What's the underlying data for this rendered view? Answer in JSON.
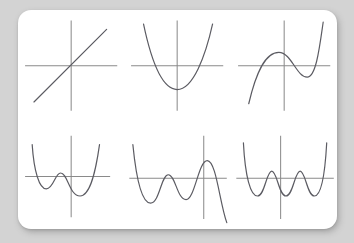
{
  "page": {
    "background_color": "#d3d3d3",
    "card_color": "#ffffff",
    "axis_color": "#8a8a8a",
    "curve_color": "#5c5c63"
  },
  "chart_data": [
    {
      "type": "line",
      "title": "Degree 1 linear function",
      "degree": 1,
      "leading_coefficient_sign": "positive",
      "turning_points": 0,
      "x_intercepts": 1,
      "shape": "straight line through origin with positive slope",
      "grid": false,
      "legend": "none",
      "xlabel": "",
      "ylabel": "",
      "xlim": [
        -5,
        5
      ],
      "ylim": [
        -5,
        5
      ],
      "x": [
        -4.2,
        -3,
        -2,
        -1,
        0,
        1,
        2,
        3,
        3.6
      ],
      "y": [
        -4.2,
        -3,
        -2,
        -1,
        0,
        1,
        2,
        3,
        3.6
      ],
      "axis": {
        "x_axis_y": 0,
        "y_axis_x": 0
      },
      "path": "M 18 102 L 100 20",
      "axis_h": "M 8 61 L 112 61",
      "axis_v": "M 60 10 L 60 112"
    },
    {
      "type": "line",
      "title": "Degree 2 quadratic function",
      "degree": 2,
      "leading_coefficient_sign": "positive",
      "turning_points": 1,
      "x_intercepts": 2,
      "shape": "upward parabola with vertex below the x-axis",
      "grid": false,
      "legend": "none",
      "xlabel": "",
      "ylabel": "",
      "xlim": [
        -5,
        5
      ],
      "ylim": [
        -5,
        5
      ],
      "x": [
        -2.6,
        -2,
        -1,
        0,
        0.4,
        1,
        2,
        2.6,
        3.2
      ],
      "y": [
        4.5,
        2.4,
        -0.2,
        -1.5,
        -1.7,
        -1.2,
        1.2,
        3.4,
        5.2
      ],
      "axis": {
        "x_axis_y": 0,
        "y_axis_x": 0
      },
      "path": "M 22 14 C 30 52, 42 88, 60 88 C 78 88, 92 50, 100 14",
      "axis_h": "M 8 61 L 112 61",
      "axis_v": "M 60 10 L 60 112"
    },
    {
      "type": "line",
      "title": "Degree 3 cubic function",
      "degree": 3,
      "leading_coefficient_sign": "positive",
      "turning_points": 2,
      "x_intercepts": 3,
      "shape": "cubic rising from lower-left with a local maximum then a local minimum",
      "grid": false,
      "legend": "none",
      "xlabel": "",
      "ylabel": "",
      "xlim": [
        -5,
        5
      ],
      "ylim": [
        -5,
        5
      ],
      "x": [
        -3.4,
        -2.6,
        -1.8,
        -1,
        -0.2,
        0.6,
        1.4,
        2.2,
        2.8
      ],
      "y": [
        -4.6,
        -1.4,
        0.7,
        1.3,
        0.9,
        -0.3,
        -0.9,
        1.6,
        5.0
      ],
      "axis": {
        "x_axis_y": 0,
        "y_axis_x": 0
      },
      "path": "M 20 104 C 28 70, 38 46, 54 46 C 68 46, 74 74, 86 74 C 96 74, 100 40, 104 12",
      "axis_h": "M 8 61 L 112 61",
      "axis_v": "M 60 10 L 60 112"
    },
    {
      "type": "line",
      "title": "Degree 4 quartic function",
      "degree": 4,
      "leading_coefficient_sign": "positive",
      "turning_points": 3,
      "x_intercepts": 3,
      "shape": "W-shaped quartic with two local minima and one local maximum",
      "grid": false,
      "legend": "none",
      "xlabel": "",
      "ylabel": "",
      "xlim": [
        -5,
        5
      ],
      "ylim": [
        -5,
        5
      ],
      "x": [
        -3.2,
        -2.6,
        -2,
        -1.4,
        -0.6,
        0.2,
        1,
        1.8,
        2.6
      ],
      "y": [
        4.6,
        1.4,
        -0.5,
        0.3,
        -0.9,
        -1.6,
        -1.2,
        1.6,
        4.8
      ],
      "axis": {
        "x_axis_y": 0,
        "y_axis_x": 0
      },
      "path": "M 16 26 C 18 56, 24 76, 32 76 C 40 76, 42 58, 48 58 C 56 58, 58 84, 70 84 C 82 84, 88 54, 92 26",
      "axis_h": "M 8 62 L 104 62",
      "axis_v": "M 60 16 L 60 108"
    },
    {
      "type": "line",
      "title": "Degree 5 quintic function",
      "degree": 5,
      "leading_coefficient_sign": "negative",
      "turning_points": 4,
      "x_intercepts": 5,
      "shape": "quintic falling from upper-left, oscillating through four turning points, then falling to lower-right",
      "grid": false,
      "legend": "none",
      "xlabel": "",
      "ylabel": "",
      "xlim": [
        -5,
        5
      ],
      "ylim": [
        -5,
        5
      ],
      "x": [
        -3.8,
        -3.2,
        -2.6,
        -2,
        -1.4,
        -0.6,
        0.2,
        0.8,
        1.6,
        2.4
      ],
      "y": [
        4.4,
        0.2,
        -2.2,
        0.6,
        -1.8,
        0.4,
        1.5,
        0.6,
        -2.4,
        -5.0
      ],
      "axis": {
        "x_axis_y": 0,
        "y_axis_x": 0
      },
      "path": "M 10 26 C 14 66, 20 92, 30 92 C 40 92, 42 60, 50 60 C 58 60, 60 88, 70 88 C 80 88, 84 44, 94 44 C 104 44, 108 92, 116 114",
      "axis_h": "M 6 64 L 116 64",
      "axis_v": "M 90 16 L 90 110"
    },
    {
      "type": "line",
      "title": "Degree 6 sextic function",
      "degree": 6,
      "leading_coefficient_sign": "positive",
      "turning_points": 5,
      "x_intercepts": 6,
      "shape": "sextic with three local minima and two local maxima, both tails rising",
      "grid": false,
      "legend": "none",
      "xlabel": "",
      "ylabel": "",
      "xlim": [
        -5,
        5
      ],
      "ylim": [
        -5,
        5
      ],
      "x": [
        -3.4,
        -2.8,
        -2.2,
        -1.6,
        -1,
        -0.4,
        0.2,
        0.8,
        1.4,
        2,
        2.6
      ],
      "y": [
        4.8,
        0.6,
        -1.8,
        0.5,
        -1.6,
        0.5,
        -1.6,
        0.5,
        -1.8,
        0.6,
        4.8
      ],
      "axis": {
        "x_axis_y": 0,
        "y_axis_x": 0
      },
      "path": "M 14 24 C 16 62, 22 84, 30 84 C 38 84, 40 56, 46 56 C 52 56, 54 84, 62 84 C 70 84, 72 56, 78 56 C 84 56, 86 84, 94 84 C 102 84, 106 60, 108 24",
      "axis_h": "M 6 64 L 116 64",
      "axis_v": "M 56 16 L 56 110"
    }
  ]
}
